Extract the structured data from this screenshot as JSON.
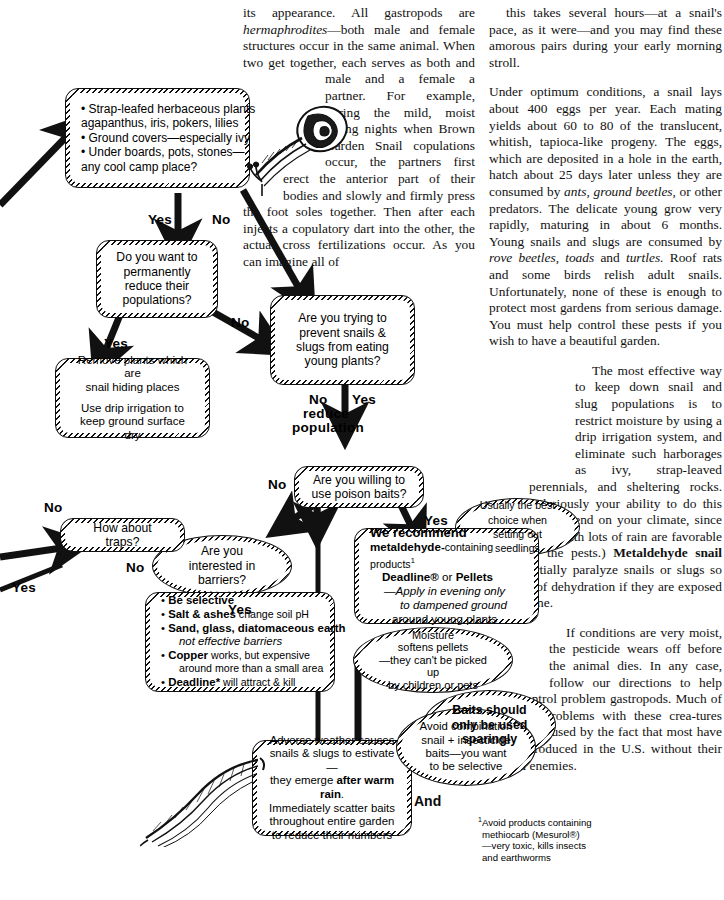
{
  "page": {
    "width": 724,
    "height": 900
  },
  "columns": {
    "middle": [
      "its appearance.  All gastropods are <i>hermaphrodites</i>—both male and female structures occur in the same animal. When two get together, each serves as both and male and a female a partner.  For example, during the mild, moist spring nights when Brown Garden Snail copulations occur, the partners first erect the anterior part of their bodies and slowly and firmly press the foot soles together.  Then after each injects a copulatory dart into the other, the actual cross fertilizations occur.  As you can imagine all of"
    ],
    "right": [
      "this takes several hours—at a snail's pace, as it were—and you may find these amorous pairs during your early morning stroll.",
      "Under optimum conditions, a snail lays about 400 eggs per year.  Each mating yields about 60 to 80 of the translucent, whitish, tapioca-like progeny.  The eggs,  which are deposited in a hole in the earth, hatch about 25 days later unless they are consumed by <i>ants, ground beetles,</i> or other predators.  The delicate young grow very rapidly, maturing in about 6 months. Young snails and slugs are consumed by <i>rove beetles, toads</i> and <i>turtles.</i> Roof rats and some birds relish adult snails. Unfortunately, none of these is enough to protect most gardens from serious damage.  You must help control these pests if you wish to have a beautiful garden.",
      "The most effective way to keep down snail and slug populations is to restrict moisture by using a drip irrigation system, and eliminate such harborages as ivy, strap-leaved perennials, and sheltering rocks. (Obviously your ability to do this will depend on your climate, since areas with lots of rain are favorable to the pests.) <b>Metaldehyde snail baits</b> partially paralyze snails or slugs so they die of dehydration if they are exposed to sunshine.",
      "If conditions are very moist, the pesticide wears off before the animal dies.  In any case, follow our directions to help control problem gastropods.  Much of our problems with these crea-tures are caused by the fact that most have been introduced in the U.S. without their natural  enemies."
    ]
  },
  "flow": {
    "nodes": {
      "habitat": {
        "name": "habitat-checklist",
        "lines": [
          "• Strap-leafed herbaceous plants",
          "   agapanthus, iris, pokers, lilies",
          "• Ground covers—especially ivy",
          "• Under boards, pots, stones—",
          "   any cool camp place?"
        ]
      },
      "permanent": {
        "name": "permanently-reduce-question",
        "text": "Do you want to permanently reduce their populations?"
      },
      "prevent": {
        "name": "prevent-eating-question",
        "text": "Are you trying to prevent snails & slugs from eating young plants?"
      },
      "remove": {
        "name": "remove-plants-action",
        "line1": "Remove plants which are",
        "line2": "snail hiding places",
        "line3": "Use drip irrigation to",
        "line4": "keep ground surface dry"
      },
      "poison": {
        "name": "poison-baits-question",
        "text": "Are you willing to use poison baits?"
      },
      "barriers": {
        "name": "barriers-question",
        "text": "Are you interested in barriers?"
      },
      "traps": {
        "name": "traps-question",
        "text": "How about traps?"
      },
      "seedlings": {
        "name": "seedlings-tip",
        "text": "Usually the best choice when setting out seedlings"
      },
      "recommend": {
        "name": "we-recommend-action",
        "l1": "We recommend",
        "l2a": "metaldehyde-",
        "l2b": "containing products",
        "l2sup": "1",
        "l3a": "Deadline®",
        "l3b": " or ",
        "l3c": "Pellets",
        "l4": "—Apply in evening only",
        "l5": "to dampened ground",
        "l6": "around young plants"
      },
      "moisture": {
        "name": "moisture-softens-pellets-note",
        "l1": "Moisture",
        "l2": "softens pellets",
        "l3": "—they can't be picked up",
        "l4": "by children or pets"
      },
      "sparingly": {
        "name": "baits-sparingly-note",
        "l1": "Baits should",
        "l2": "only be used",
        "l3": "sparingly"
      },
      "selective": {
        "name": "be-selective-action",
        "items": [
          {
            "bold": "Be selective",
            "rest": ""
          },
          {
            "bold": "Salt & ashes",
            "rest": " change soil pH"
          },
          {
            "bold": "Sand, glass, diatomaceous earth",
            "rest": ""
          },
          {
            "bold": "",
            "rest": "not effective barriers",
            "italic": true,
            "nobullet": true
          },
          {
            "bold": "Copper",
            "rest": " works, but expensive"
          },
          {
            "bold": "",
            "rest": "around more than a small area",
            "nobullet": true
          },
          {
            "bold": "Deadline*",
            "rest": " will attract & kill"
          }
        ]
      },
      "weather": {
        "name": "adverse-weather-action",
        "l1": "Adverse weather causes",
        "l2": "snails & slugs to estivate—",
        "l3a": "they emerge ",
        "l3b": "after warm rain",
        "l3c": ".",
        "l4": "Immediately scatter baits",
        "l5": "throughout entire garden",
        "l6": "to reduce their numbers"
      },
      "combination": {
        "name": "avoid-combination-note",
        "l1": "Avoid combination",
        "l2": "snail + insecticide",
        "l3": "baits—you want",
        "l4": "to be selective"
      }
    },
    "labels": {
      "yes1": "Yes",
      "no1": "No",
      "no2": "No",
      "yes2": "Yes",
      "no3a": "No",
      "no3b": "reduce",
      "no3c": "population",
      "yes3": "Yes",
      "no4": "No",
      "yes4": "Yes",
      "no5": "No",
      "yes5": "Yes",
      "no6": "No",
      "yes6": "Yes",
      "and": "And"
    },
    "footnote": {
      "name": "footnote-methiocarb",
      "sup": "1",
      "l1": "Avoid products containing",
      "l2": "methiocarb (Mesurol®)",
      "l3": "—very toxic, kills insects",
      "l4": "and earthworms"
    }
  }
}
